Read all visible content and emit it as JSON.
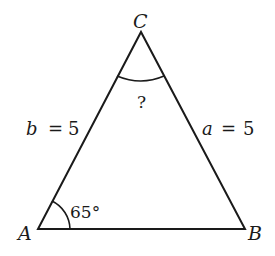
{
  "diagram": {
    "type": "triangle",
    "vertices": {
      "A": {
        "label": "A"
      },
      "B": {
        "label": "B"
      },
      "C": {
        "label": "C"
      }
    },
    "sides": {
      "b": {
        "var": "b",
        "eq": "=",
        "value": "5",
        "text": "b = 5"
      },
      "a": {
        "var": "a",
        "eq": "=",
        "value": "5",
        "text": "a = 5"
      }
    },
    "angles": {
      "A": {
        "text": "65°"
      },
      "C": {
        "text": "?"
      }
    },
    "colors": {
      "stroke": "#1a1a1a",
      "background": "#ffffff"
    }
  }
}
